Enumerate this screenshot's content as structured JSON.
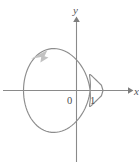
{
  "figure": {
    "width": 139,
    "height": 164,
    "background_color": "#ffffff",
    "axis_color": "#8a8a8a",
    "curve_color": "#8d8d8d",
    "direction_arrow_color": "#c2c2c2"
  },
  "labels": {
    "y_axis": "y",
    "x_axis": "x",
    "origin": "0",
    "unit_x": "1"
  },
  "chart_data": {
    "type": "line",
    "title": "",
    "xlabel": "x",
    "ylabel": "y",
    "subtitle": "",
    "grid": false,
    "legend": null,
    "curve_name": "cardioid",
    "polar_equation": "r = 1 - cos(theta)",
    "coordinate_system": "polar curve drawn on cartesian axes",
    "cusp_point": [
      1,
      0
    ],
    "leftmost_point": [
      -2,
      0
    ],
    "topmost_point": [
      -0.65,
      1.3
    ],
    "bottommost_point": [
      -0.65,
      -1.3
    ],
    "xlim": [
      -2.7,
      2.05
    ],
    "ylim": [
      -2.65,
      2.65
    ],
    "x_ticks": [
      0,
      1
    ],
    "x_tick_labels": [
      "0",
      "1"
    ],
    "y_ticks": [],
    "y_tick_labels": [],
    "annotations": [
      {
        "name": "direction-arrow",
        "text": "",
        "meaning": "counterclockwise traversal direction",
        "at": [
          -1.45,
          0.95
        ]
      }
    ],
    "x": [
      -2.0,
      -1.996,
      -1.985,
      -1.966,
      -1.94,
      -1.906,
      -1.866,
      -1.819,
      -1.765,
      -1.705,
      -1.638,
      -1.566,
      -1.489,
      -1.407,
      -1.321,
      -1.231,
      -1.138,
      -1.042,
      -0.944,
      -0.845,
      -0.745,
      -0.645,
      -0.545,
      -0.447,
      -0.351,
      -0.258,
      -0.168,
      -0.082,
      0.0,
      0.077,
      0.148,
      0.214,
      0.273,
      0.326,
      0.372,
      0.412,
      0.445,
      0.472,
      0.493,
      0.508,
      0.518,
      0.523,
      0.524,
      0.521,
      0.516,
      0.509,
      0.502,
      0.496,
      0.492,
      0.492,
      0.497,
      0.51,
      0.531,
      0.563,
      0.607,
      0.665,
      0.739,
      0.831,
      0.941,
      1.0
    ],
    "y": [
      0.0,
      0.131,
      0.261,
      0.389,
      0.515,
      0.637,
      0.755,
      0.868,
      0.975,
      1.075,
      1.168,
      1.253,
      1.329,
      1.396,
      1.453,
      1.5,
      1.537,
      1.563,
      1.578,
      1.582,
      1.575,
      1.557,
      1.529,
      1.49,
      1.441,
      1.383,
      1.316,
      1.241,
      1.158,
      1.069,
      0.974,
      0.875,
      0.772,
      0.667,
      0.56,
      0.453,
      0.346,
      0.241,
      0.139,
      0.04,
      -0.054,
      -0.143,
      -0.227,
      -0.304,
      -0.374,
      -0.436,
      -0.49,
      -0.534,
      -0.568,
      -0.592,
      -0.604,
      -0.604,
      -0.591,
      -0.565,
      -0.524,
      -0.468,
      -0.396,
      -0.307,
      -0.198,
      -0.0
    ]
  }
}
